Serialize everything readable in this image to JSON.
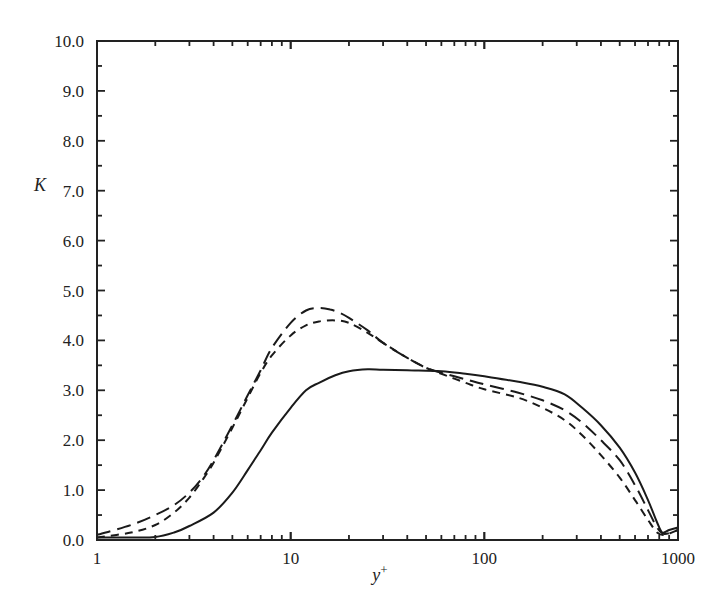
{
  "chart_data": {
    "type": "line",
    "title": "",
    "xlabel": "y+",
    "xlabel_main": "y",
    "xlabel_sup": "+",
    "ylabel": "K",
    "xscale": "log",
    "xlim": [
      1,
      1000
    ],
    "ylim": [
      0,
      10
    ],
    "grid": false,
    "legend": null,
    "x_ticks": [
      {
        "value": 1,
        "label": "1"
      },
      {
        "value": 10,
        "label": "10"
      },
      {
        "value": 100,
        "label": "100"
      },
      {
        "value": 1000,
        "label": "1000"
      }
    ],
    "y_ticks": [
      {
        "value": 0,
        "label": "0.0"
      },
      {
        "value": 1,
        "label": "1.0"
      },
      {
        "value": 2,
        "label": "2.0"
      },
      {
        "value": 3,
        "label": "3.0"
      },
      {
        "value": 4,
        "label": "4.0"
      },
      {
        "value": 5,
        "label": "5.0"
      },
      {
        "value": 6,
        "label": "6.0"
      },
      {
        "value": 7,
        "label": "7.0"
      },
      {
        "value": 8,
        "label": "8.0"
      },
      {
        "value": 9,
        "label": "9.0"
      },
      {
        "value": 10,
        "label": "10.0"
      }
    ],
    "series": [
      {
        "name": "solid",
        "style": "solid",
        "x": [
          1,
          1.5,
          2,
          2.5,
          3,
          4,
          5,
          6,
          7,
          8,
          10,
          12,
          14,
          17,
          20,
          25,
          30,
          40,
          60,
          80,
          100,
          150,
          200,
          260,
          320,
          400,
          500,
          600,
          700,
          780,
          830,
          900,
          1000
        ],
        "y": [
          0.05,
          0.05,
          0.06,
          0.15,
          0.28,
          0.55,
          0.95,
          1.4,
          1.8,
          2.15,
          2.65,
          3.0,
          3.15,
          3.3,
          3.38,
          3.42,
          3.41,
          3.4,
          3.38,
          3.33,
          3.28,
          3.17,
          3.07,
          2.92,
          2.65,
          2.3,
          1.85,
          1.35,
          0.8,
          0.35,
          0.15,
          0.2,
          0.25
        ]
      },
      {
        "name": "long-dash",
        "style": "dashed-long",
        "x": [
          1,
          1.5,
          2,
          2.5,
          3,
          3.5,
          4,
          5,
          6,
          7,
          8,
          10,
          12,
          14,
          16,
          18,
          20,
          25,
          30,
          40,
          50,
          60,
          80,
          100,
          150,
          200,
          260,
          320,
          400,
          500,
          600,
          700,
          780,
          850,
          1000
        ],
        "y": [
          0.1,
          0.3,
          0.5,
          0.7,
          0.95,
          1.25,
          1.6,
          2.3,
          2.9,
          3.4,
          3.85,
          4.35,
          4.6,
          4.65,
          4.62,
          4.55,
          4.45,
          4.2,
          3.95,
          3.65,
          3.45,
          3.35,
          3.22,
          3.12,
          2.95,
          2.8,
          2.6,
          2.35,
          2.0,
          1.6,
          1.1,
          0.6,
          0.25,
          0.12,
          0.2
        ]
      },
      {
        "name": "short-dash",
        "style": "dashed-short",
        "x": [
          1,
          1.5,
          2,
          2.5,
          3,
          3.5,
          4,
          5,
          6,
          7,
          8,
          10,
          12,
          14,
          17,
          20,
          25,
          30,
          40,
          50,
          60,
          80,
          100,
          150,
          200,
          260,
          320,
          400,
          500,
          600,
          700,
          780,
          850,
          1000
        ],
        "y": [
          0.05,
          0.15,
          0.3,
          0.55,
          0.85,
          1.2,
          1.55,
          2.25,
          2.85,
          3.35,
          3.7,
          4.1,
          4.3,
          4.38,
          4.4,
          4.35,
          4.15,
          3.95,
          3.65,
          3.45,
          3.33,
          3.15,
          3.02,
          2.85,
          2.65,
          2.4,
          2.1,
          1.7,
          1.25,
          0.8,
          0.4,
          0.15,
          0.1,
          0.2
        ]
      }
    ]
  }
}
